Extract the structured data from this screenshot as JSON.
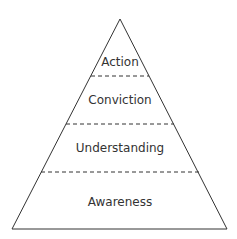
{
  "diagram": {
    "type": "pyramid",
    "levels": [
      {
        "label": "Action"
      },
      {
        "label": "Conviction"
      },
      {
        "label": "Understanding"
      },
      {
        "label": "Awareness"
      }
    ],
    "colors": {
      "stroke": "#333333",
      "background": "#ffffff"
    }
  }
}
